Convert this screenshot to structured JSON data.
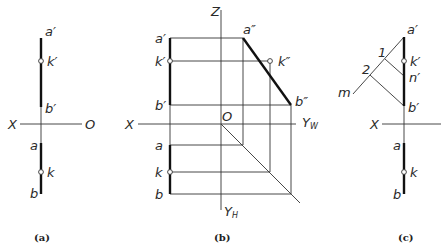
{
  "panels": [
    {
      "id": "a",
      "caption": "(a)",
      "labels": {
        "a_prime": "a′",
        "k_prime": "k′",
        "b_prime": "b′",
        "x_axis": "X",
        "origin": "O",
        "a": "a",
        "k": "k",
        "b": "b"
      }
    },
    {
      "id": "b",
      "caption": "(b)",
      "labels": {
        "z_axis": "Z",
        "a_prime": "a′",
        "k_prime": "k′",
        "b_prime": "b′",
        "a_dprime": "a″",
        "k_dprime": "k″",
        "b_dprime": "b″",
        "x_axis": "X",
        "origin": "O",
        "yw_axis": "Y",
        "yw_sub": "W",
        "a": "a",
        "k": "k",
        "b": "b",
        "yh_axis": "Y",
        "yh_sub": "H"
      }
    },
    {
      "id": "c",
      "caption": "(c)",
      "labels": {
        "a_prime": "a′",
        "k_prime": "k′",
        "n_prime": "n′",
        "b_prime": "b′",
        "point_1": "1",
        "point_2": "2",
        "line_m": "m",
        "x_axis": "X",
        "a": "a",
        "k": "k",
        "b": "b"
      }
    }
  ]
}
